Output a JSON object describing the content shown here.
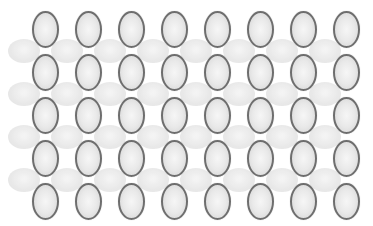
{
  "pattern": {
    "background": "#ffffff",
    "vertical_ovals": {
      "rows": 5,
      "cols": 8,
      "origin_center": [
        45.5,
        29.5
      ],
      "spacing": [
        43,
        43
      ],
      "size": [
        27,
        37
      ],
      "border_color": "#6e6e6e",
      "fill_color": "#e9e9e9"
    },
    "horizontal_ovals": {
      "rows": 4,
      "cols": 8,
      "origin_center": [
        24,
        51
      ],
      "spacing": [
        43,
        43
      ],
      "size": [
        32,
        24
      ],
      "fill_color": "#e6e6e6"
    }
  }
}
